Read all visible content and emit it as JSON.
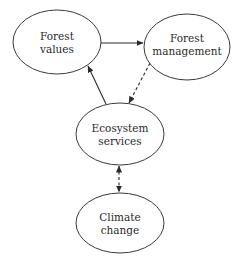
{
  "diagram": {
    "type": "concept-flow",
    "nodes": [
      {
        "id": "forest_values",
        "line1": "Forest",
        "line2": "values",
        "cx": 57,
        "cy": 42,
        "rx": 44,
        "ry": 32
      },
      {
        "id": "forest_management",
        "line1": "Forest",
        "line2": "management",
        "cx": 187,
        "cy": 47,
        "rx": 43,
        "ry": 33
      },
      {
        "id": "ecosystem_services",
        "line1": "Ecosystem",
        "line2": "services",
        "cx": 120,
        "cy": 134,
        "rx": 44,
        "ry": 31
      },
      {
        "id": "climate_change",
        "line1": "Climate",
        "line2": "change",
        "cx": 120,
        "cy": 223,
        "rx": 44,
        "ry": 30
      }
    ],
    "edges": [
      {
        "from": "forest_values",
        "to": "forest_management",
        "style": "solid",
        "direction": "forward"
      },
      {
        "from": "forest_management",
        "to": "ecosystem_services",
        "style": "dashed",
        "direction": "forward"
      },
      {
        "from": "ecosystem_services",
        "to": "forest_values",
        "style": "solid",
        "direction": "forward"
      },
      {
        "from": "ecosystem_services",
        "to": "climate_change",
        "style": "dashed",
        "direction": "both"
      }
    ],
    "colors": {
      "stroke": "#3a3a3a",
      "text": "#2a2a2a",
      "background": "#ffffff"
    }
  }
}
